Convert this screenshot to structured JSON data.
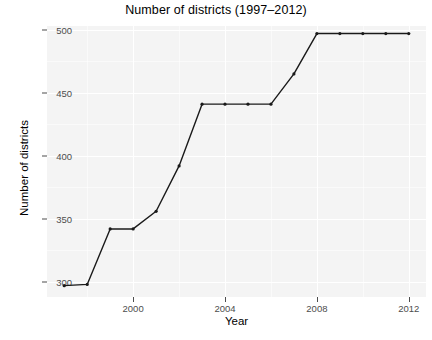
{
  "chart_data": {
    "type": "line",
    "title": "Number of districts (1997–2012)",
    "xlabel": "Year",
    "ylabel": "Number of districts",
    "x": [
      1997,
      1998,
      1999,
      2000,
      2001,
      2002,
      2003,
      2004,
      2005,
      2006,
      2007,
      2008,
      2009,
      2010,
      2011,
      2012
    ],
    "values": [
      297,
      298,
      342,
      342,
      356,
      392,
      441,
      441,
      441,
      441,
      465,
      497,
      497,
      497,
      497,
      497
    ],
    "series": [
      {
        "name": "Number of districts",
        "values": [
          297,
          298,
          342,
          342,
          356,
          392,
          441,
          441,
          441,
          441,
          465,
          497,
          497,
          497,
          497,
          497
        ]
      }
    ],
    "xlim": [
      1996.25,
      2012.75
    ],
    "ylim": [
      288,
      503
    ],
    "xticks": [
      2000,
      2004,
      2008,
      2012
    ],
    "xtick_labels": [
      "2000",
      "2004",
      "2008",
      "2012"
    ],
    "yticks": [
      300,
      350,
      400,
      450,
      500
    ],
    "ytick_labels": [
      "300",
      "350",
      "400",
      "450",
      "500"
    ],
    "grid": true,
    "legend": false,
    "line_color": "#1a1a1a",
    "panel_background": "#f4f4f4",
    "grid_color": "#ffffff",
    "marker": "point"
  }
}
